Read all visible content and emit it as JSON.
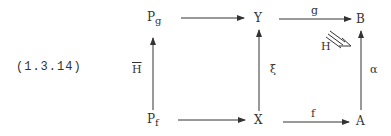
{
  "equation_number": "(1.3.14)",
  "nodes": {
    "pg": {
      "base": "P",
      "sub": "g"
    },
    "pf": {
      "base": "P",
      "sub": "f"
    },
    "y": "Y",
    "b": "B",
    "x": "X",
    "a": "A"
  },
  "arrows": {
    "pf_to_pg": {
      "label": "H"
    },
    "pg_to_y": {
      "label": ""
    },
    "y_to_b": {
      "label": "g"
    },
    "x_to_y": {
      "label": "ξ"
    },
    "a_to_b": {
      "label": "α"
    },
    "pf_to_x": {
      "label": ""
    },
    "x_to_a": {
      "label": "f"
    },
    "homotopy": {
      "label": "H"
    }
  },
  "colors": {
    "ink": "#333333",
    "background": "#ffffff"
  }
}
